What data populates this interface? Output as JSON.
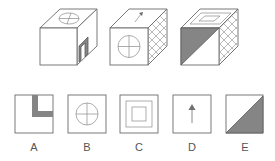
{
  "question": {
    "cubes": [
      {
        "id": "cube-1",
        "top": "circle-with-cross",
        "front": "blank",
        "right": "shaded-corner-bar"
      },
      {
        "id": "cube-2",
        "top": "arrow",
        "front": "circle-with-cross",
        "right": "crosshatch"
      },
      {
        "id": "cube-3",
        "top": "nested-squares",
        "front": "diagonal-half-shaded",
        "right": "crosshatch"
      }
    ]
  },
  "options": [
    {
      "label": "A",
      "pattern": "shaded-corner-bar"
    },
    {
      "label": "B",
      "pattern": "circle-with-cross"
    },
    {
      "label": "C",
      "pattern": "nested-squares"
    },
    {
      "label": "D",
      "pattern": "arrow"
    },
    {
      "label": "E",
      "pattern": "diagonal-half-shaded"
    }
  ],
  "colors": {
    "line": "#6a6a6a",
    "shade": "#858585",
    "background": "#ffffff"
  }
}
